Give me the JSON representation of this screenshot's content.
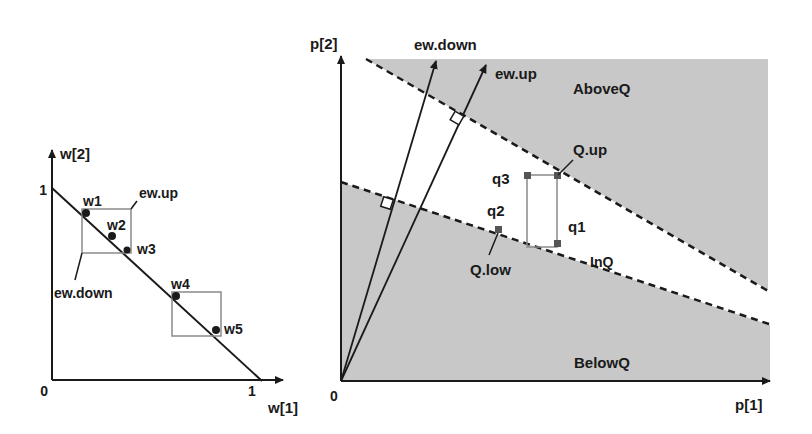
{
  "left_plot": {
    "x_axis_label": "w[1]",
    "y_axis_label": "w[2]",
    "origin_label": "0",
    "x_tick_one": "1",
    "y_tick_one": "1",
    "points": [
      {
        "label": "w1"
      },
      {
        "label": "w2"
      },
      {
        "label": "w3"
      },
      {
        "label": "w4"
      },
      {
        "label": "w5"
      }
    ],
    "callouts": {
      "up": "ew.up",
      "down": "ew.down"
    }
  },
  "right_plot": {
    "x_axis_label": "p[1]",
    "y_axis_label": "p[2]",
    "origin_label": "0",
    "vectors": {
      "down": "ew.down",
      "up": "ew.up"
    },
    "regions": {
      "above": "AboveQ",
      "in": "InQ",
      "below": "BelowQ"
    },
    "points": {
      "q1": "q1",
      "q2": "q2",
      "q3": "q3"
    },
    "callouts": {
      "up": "Q.up",
      "low": "Q.low"
    }
  },
  "colors": {
    "shade": "#c8c8c8",
    "line": "#1a1a1a",
    "box": "#8a8a8a",
    "point": "#555555"
  }
}
